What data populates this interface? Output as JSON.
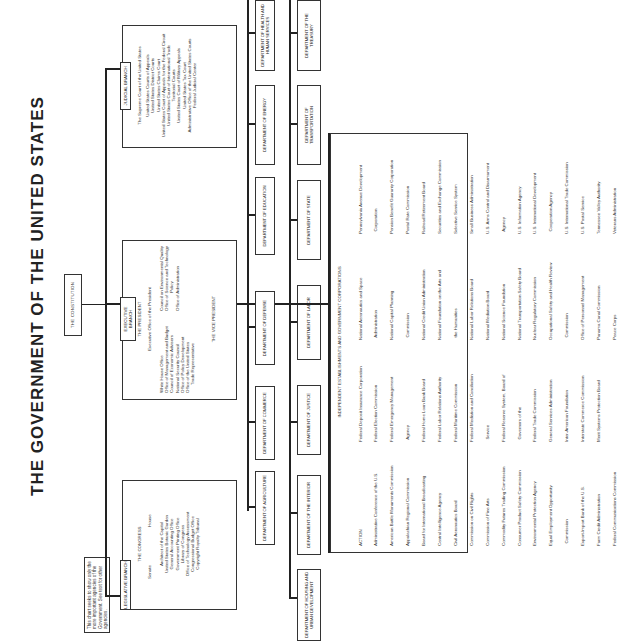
{
  "title": "THE GOVERNMENT OF THE UNITED STATES",
  "note": "This chart seeks to show only the more important agencies of the Government. See text for other agencies.",
  "constitution": "THE CONSTITUTION",
  "legislative": {
    "tag": "LEGISLATIVE BRANCH",
    "heading": "THE CONGRESS",
    "senate": "Senate",
    "house": "House",
    "items": [
      "Architect of the Capitol",
      "United States Botanic Garden",
      "General Accounting Office",
      "Government Printing Office",
      "Library of Congress",
      "Office of Technology Assessment",
      "Congressional Budget Office",
      "Copyright Royalty Tribunal"
    ]
  },
  "executive": {
    "tag": "EXECUTIVE BRANCH",
    "heading": "THE PRESIDENT",
    "subheading": "Executive Office of the President",
    "left_items": [
      "White House Office",
      "Office of Management and Budget",
      "Council of Economic Advisers",
      "National Security Council",
      "Office of Policy Development",
      "Office of the United States",
      "Trade Representative"
    ],
    "right_items": [
      "Council on Environmental Quality",
      "Office of Science and Technology",
      "Policy",
      "Office of Administration"
    ],
    "vice_president": "THE VICE PRESIDENT"
  },
  "judicial": {
    "tag": "JUDICIAL BRANCH",
    "items": [
      "The Supreme Court of the United States",
      "United States Courts of Appeals",
      "United States District Courts",
      "United States Claims Court",
      "United States Court of Appeals for the Federal Circuit",
      "United States Court of International Trade",
      "Territorial Courts",
      "United States Court of Military Appeals",
      "United States Tax Court",
      "Administrative Office of the United States Courts",
      "Federal Judicial Center"
    ]
  },
  "departments_row1": [
    "DEPARTMENT OF AGRICULTURE",
    "DEPARTMENT OF COMMERCE",
    "DEPARTMENT OF DEFENSE",
    "DEPARTMENT OF EDUCATION",
    "DEPARTMENT OF ENERGY",
    "DEPARTMENT OF HEALTH AND HUMAN SERVICES"
  ],
  "departments_row2": [
    "DEPARTMENT OF HOUSING AND URBAN DEVELOPMENT",
    "DEPARTMENT OF THE INTERIOR",
    "DEPARTMENT OF JUSTICE",
    "DEPARTMENT OF LABOR",
    "DEPARTMENT OF STATE",
    "DEPARTMENT OF TRANSPORTATION",
    "DEPARTMENT OF THE TREASURY"
  ],
  "independent": {
    "heading": "INDEPENDENT ESTABLISHMENTS AND GOVERNMENT CORPORATIONS",
    "col1": [
      "ACTION",
      "Administrative Conference of the U.S.",
      "American Battle Monuments Commission",
      "Appalachian Regional Commission",
      "Board for International Broadcasting",
      "Central Intelligence Agency",
      "Civil Aeronautics Board",
      "Commission on Civil Rights",
      "Commission of Fine Arts",
      "Commodity Futures Trading Commission",
      "Consumer Product Safety Commission",
      "Environmental Protection Agency",
      "Equal Employment Opportunity",
      "  Commission",
      "Export-Import Bank of the U.S.",
      "Farm Credit Administration",
      "Federal Communications Commission"
    ],
    "col2": [
      "Federal Deposit Insurance Corporation",
      "Federal Election Commission",
      "Federal Emergency Management",
      "  Agency",
      "Federal Home Loan Bank Board",
      "Federal Labor Relations Authority",
      "Federal Maritime Commission",
      "Federal Mediation and Conciliation",
      "  Service",
      "Federal Reserve System, Board of",
      "  Governors of the",
      "Federal Trade Commission",
      "General Services Administration",
      "Inter-American Foundation",
      "Interstate Commerce Commission",
      "Merit Systems Protection Board"
    ],
    "col3": [
      "National Aeronautics and Space",
      "  Administration",
      "National Capital Planning",
      "  Commission",
      "National Credit Union Administration",
      "National Foundation on the Arts and",
      "  the Humanities",
      "National Labor Relations Board",
      "National Mediation Board",
      "National Science Foundation",
      "National Transportation Safety Board",
      "Nuclear Regulatory Commission",
      "Occupational Safety and Health Review",
      "  Commission",
      "Office of Personnel Management",
      "Panama Canal Commission",
      "Peace Corps"
    ],
    "col4": [
      "Pennsylvania Avenue Development",
      "  Corporation",
      "Pension Benefit Guaranty Corporation",
      "Postal Rate Commission",
      "Railroad Retirement Board",
      "Securities and Exchange Commission",
      "Selective Service System",
      "Small Business Administration",
      "U.S. Arms Control and Disarmament",
      "  Agency",
      "U.S. Information Agency",
      "U.S. International Development",
      "  Cooperation Agency",
      "U.S. International Trade Commission",
      "U.S. Postal Service",
      "Tennessee Valley Authority",
      "Veterans Administration"
    ]
  }
}
